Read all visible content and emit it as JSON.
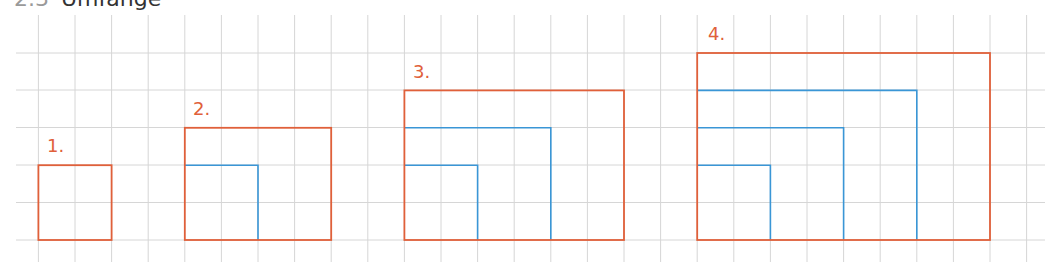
{
  "heading": {
    "number": "2.3",
    "title": "Umfänge"
  },
  "grid": {
    "color": "#d6d6d6",
    "cell_w": 36.6,
    "cell_h": 37.4,
    "x_start": 38.4,
    "columns": 28,
    "h_lines_y": [
      53,
      90,
      127.5,
      165,
      202.5,
      240
    ],
    "x_left": 16,
    "x_right": 1045,
    "y_top": 15,
    "y_bottom": 262
  },
  "colors": {
    "outer": "#e0603a",
    "inner": "#3a96d6"
  },
  "figures": [
    {
      "label": "1.",
      "label_x": 47,
      "label_y": 137,
      "outer": {
        "col": 0,
        "cols": 2,
        "rows": 2
      },
      "inner": []
    },
    {
      "label": "2.",
      "label_x": 193,
      "label_y": 100,
      "outer": {
        "col": 4,
        "cols": 4,
        "rows": 3
      },
      "inner": [
        {
          "cols": 2,
          "rows": 2
        }
      ]
    },
    {
      "label": "3.",
      "label_x": 413,
      "label_y": 63,
      "outer": {
        "col": 10,
        "cols": 6,
        "rows": 4
      },
      "inner": [
        {
          "cols": 4,
          "rows": 3
        },
        {
          "cols": 2,
          "rows": 2
        }
      ]
    },
    {
      "label": "4.",
      "label_x": 708,
      "label_y": 25,
      "outer": {
        "col": 18,
        "cols": 8,
        "rows": 5
      },
      "inner": [
        {
          "cols": 6,
          "rows": 4
        },
        {
          "cols": 4,
          "rows": 3
        },
        {
          "cols": 2,
          "rows": 2
        }
      ]
    }
  ]
}
